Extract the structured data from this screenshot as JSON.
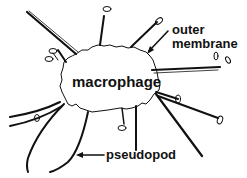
{
  "diagram": {
    "subject": "macrophage",
    "labels": {
      "cell": "macrophage",
      "outer_membrane_line1": "outer",
      "outer_membrane_line2": "membrane",
      "pseudopod": "pseudopod"
    },
    "colors": {
      "ink": "#111111",
      "background": "#ffffff"
    }
  }
}
